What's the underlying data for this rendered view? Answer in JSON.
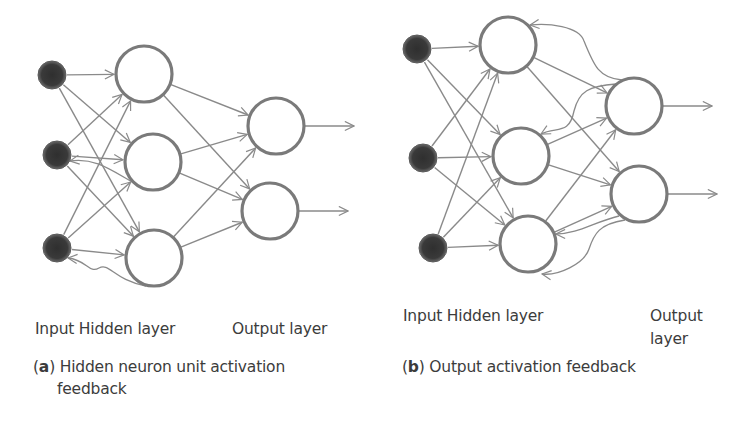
{
  "panel_a": {
    "labels": {
      "input_hidden": "Input Hidden layer",
      "output": "Output layer"
    },
    "caption": {
      "letter": "a",
      "text_line1": "Hidden neuron unit activation",
      "text_line2": "feedback"
    },
    "nodes": {
      "input": [
        {
          "id": "a-in-1",
          "x": 52,
          "y": 75,
          "r": 14
        },
        {
          "id": "a-in-2",
          "x": 57,
          "y": 155,
          "r": 14
        },
        {
          "id": "a-in-3",
          "x": 57,
          "y": 248,
          "r": 14
        }
      ],
      "hidden": [
        {
          "id": "a-h-1",
          "x": 144,
          "y": 74,
          "r": 28
        },
        {
          "id": "a-h-2",
          "x": 153,
          "y": 162,
          "r": 28
        },
        {
          "id": "a-h-3",
          "x": 154,
          "y": 258,
          "r": 28
        }
      ],
      "output": [
        {
          "id": "a-o-1",
          "x": 276,
          "y": 126,
          "r": 28
        },
        {
          "id": "a-o-2",
          "x": 270,
          "y": 211,
          "r": 28
        }
      ]
    },
    "feedback": "hidden-to-input"
  },
  "panel_b": {
    "labels": {
      "input_hidden": "Input Hidden layer",
      "output_line1": "Output",
      "output_line2": "layer"
    },
    "caption": {
      "letter": "b",
      "text": "Output activation feedback"
    },
    "nodes": {
      "input": [
        {
          "id": "b-in-1",
          "x": 417,
          "y": 49,
          "r": 14
        },
        {
          "id": "b-in-2",
          "x": 423,
          "y": 158,
          "r": 14
        },
        {
          "id": "b-in-3",
          "x": 433,
          "y": 248,
          "r": 14
        }
      ],
      "hidden": [
        {
          "id": "b-h-1",
          "x": 508,
          "y": 45,
          "r": 28
        },
        {
          "id": "b-h-2",
          "x": 521,
          "y": 156,
          "r": 28
        },
        {
          "id": "b-h-3",
          "x": 528,
          "y": 244,
          "r": 28
        }
      ],
      "output": [
        {
          "id": "b-o-1",
          "x": 634,
          "y": 106,
          "r": 28
        },
        {
          "id": "b-o-2",
          "x": 639,
          "y": 194,
          "r": 28
        }
      ]
    },
    "feedback": "output-to-hidden"
  },
  "colors": {
    "edge": "#8a8a8a",
    "node_stroke": "#7a7a7a",
    "input_fill": "#3d3d3d",
    "text": "#3c3c3c"
  }
}
